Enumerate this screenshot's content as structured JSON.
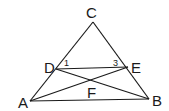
{
  "figure": {
    "type": "geometry-diagram",
    "points": {
      "A": {
        "label": "A",
        "x": 30,
        "y": 101
      },
      "B": {
        "label": "B",
        "x": 149,
        "y": 99
      },
      "C": {
        "label": "C",
        "x": 93,
        "y": 22
      },
      "D": {
        "label": "D",
        "x": 56,
        "y": 69
      },
      "E": {
        "label": "E",
        "x": 128,
        "y": 67
      },
      "F": {
        "label": "F",
        "x": 89,
        "y": 80
      }
    },
    "segments": [
      "AB",
      "AC",
      "BC",
      "DE",
      "AE",
      "DB"
    ],
    "angle_labels": [
      {
        "label": "1",
        "vertex": "D"
      },
      {
        "label": "3",
        "vertex": "E"
      }
    ]
  }
}
